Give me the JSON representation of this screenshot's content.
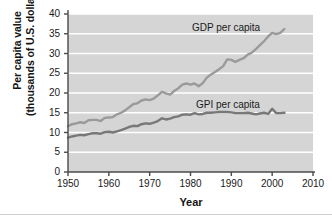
{
  "chart_data": {
    "type": "line",
    "title": "",
    "xlabel": "Year",
    "ylabel_line1": "Per capita value",
    "ylabel_line2": "(thousands of U.S. dollars)",
    "xlim": [
      1950,
      2010
    ],
    "ylim": [
      0,
      40
    ],
    "xticks": [
      1950,
      1960,
      1970,
      1980,
      1990,
      2000,
      2010
    ],
    "yticks": [
      0,
      5,
      10,
      15,
      20,
      25,
      30,
      35,
      40
    ],
    "grid": "horizontal-white",
    "legend": "inline-annotations",
    "plot_bg_color": "#d5d5d5",
    "gridline_color": "#ffffff",
    "axis_color": "#4a4a4a",
    "annotations": [
      {
        "text": "GDP per capita",
        "x": 1980,
        "y": 37.5
      },
      {
        "text": "GPI per capita",
        "x": 1981,
        "y": 18.0
      }
    ],
    "series": [
      {
        "name": "GDP per capita",
        "color": "#9a9a9a",
        "x": [
          1950,
          1951,
          1952,
          1953,
          1954,
          1955,
          1956,
          1957,
          1958,
          1959,
          1960,
          1961,
          1962,
          1963,
          1964,
          1965,
          1966,
          1967,
          1968,
          1969,
          1970,
          1971,
          1972,
          1973,
          1974,
          1975,
          1976,
          1977,
          1978,
          1979,
          1980,
          1981,
          1982,
          1983,
          1984,
          1985,
          1986,
          1987,
          1988,
          1989,
          1990,
          1991,
          1992,
          1993,
          1994,
          1995,
          1996,
          1997,
          1998,
          1999,
          2000,
          2001,
          2002,
          2003
        ],
        "values": [
          11.6,
          12.1,
          12.3,
          12.6,
          12.4,
          13.1,
          13.2,
          13.2,
          12.9,
          13.7,
          13.8,
          13.9,
          14.6,
          15.0,
          15.6,
          16.4,
          17.2,
          17.4,
          18.1,
          18.4,
          18.2,
          18.6,
          19.4,
          20.3,
          19.9,
          19.6,
          20.5,
          21.2,
          22.1,
          22.4,
          22.1,
          22.4,
          21.7,
          22.5,
          23.9,
          24.7,
          25.3,
          26.0,
          26.8,
          28.5,
          28.4,
          27.9,
          28.4,
          28.8,
          29.7,
          30.2,
          31.1,
          32.1,
          33.1,
          34.3,
          35.2,
          34.9,
          35.2,
          36.2
        ]
      },
      {
        "name": "GPI per capita",
        "color": "#787878",
        "x": [
          1950,
          1951,
          1952,
          1953,
          1954,
          1955,
          1956,
          1957,
          1958,
          1959,
          1960,
          1961,
          1962,
          1963,
          1964,
          1965,
          1966,
          1967,
          1968,
          1969,
          1970,
          1971,
          1972,
          1973,
          1974,
          1975,
          1976,
          1977,
          1978,
          1979,
          1980,
          1981,
          1982,
          1983,
          1984,
          1985,
          1986,
          1987,
          1988,
          1989,
          1990,
          1991,
          1992,
          1993,
          1994,
          1995,
          1996,
          1997,
          1998,
          1999,
          2000,
          2001,
          2002,
          2003
        ],
        "values": [
          8.7,
          9.0,
          9.2,
          9.4,
          9.3,
          9.6,
          9.8,
          9.8,
          9.7,
          10.1,
          10.2,
          10.0,
          10.3,
          10.6,
          11.0,
          11.4,
          11.7,
          11.6,
          12.1,
          12.3,
          12.2,
          12.5,
          12.9,
          13.6,
          13.3,
          13.5,
          13.9,
          14.1,
          14.5,
          14.6,
          14.5,
          14.9,
          14.6,
          14.7,
          15.0,
          15.0,
          15.1,
          15.2,
          15.2,
          15.2,
          15.1,
          14.9,
          14.9,
          14.9,
          15.0,
          14.8,
          14.6,
          14.8,
          15.0,
          14.7,
          16.0,
          14.9,
          14.9,
          15.0
        ]
      }
    ]
  }
}
